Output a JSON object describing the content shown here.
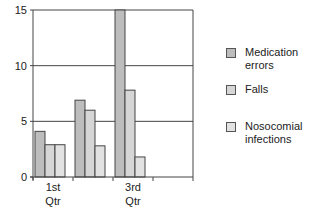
{
  "chart_data": {
    "type": "bar",
    "title": "",
    "xlabel": "",
    "ylabel": "",
    "categories": [
      "1st Qtr",
      "2nd Qtr",
      "3rd Qtr",
      "4th Qtr"
    ],
    "x_tick_labels": [
      [
        "1st",
        "Qtr"
      ],
      [
        "",
        ""
      ],
      [
        "3rd",
        "Qtr"
      ],
      [
        "",
        ""
      ]
    ],
    "ylim": [
      0,
      15
    ],
    "yticks": [
      0,
      5,
      10,
      15
    ],
    "grid": true,
    "legend_position": "right",
    "series": [
      {
        "name": "Medication errors",
        "values": [
          4.1,
          6.9,
          15,
          null
        ],
        "color": "#bdbdbd"
      },
      {
        "name": "Falls",
        "values": [
          2.9,
          6.0,
          7.8,
          null
        ],
        "color": "#d6d6d6"
      },
      {
        "name": "Nosocomial infections",
        "values": [
          2.9,
          2.8,
          1.8,
          null
        ],
        "color": "#e2e2e2"
      }
    ]
  },
  "legend": {
    "items": [
      {
        "label_lines": [
          "Medication",
          "errors"
        ],
        "color": "#bdbdbd"
      },
      {
        "label_lines": [
          "Falls"
        ],
        "color": "#d6d6d6"
      },
      {
        "label_lines": [
          "Nosocomial",
          "infections"
        ],
        "color": "#e2e2e2"
      }
    ]
  }
}
